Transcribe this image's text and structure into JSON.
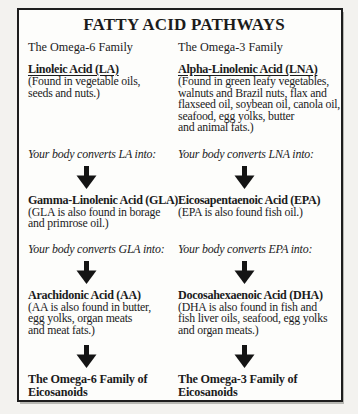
{
  "panel": {
    "title": "FATTY ACID PATHWAYS"
  },
  "omega6": {
    "family_label": "The Omega-6 Family",
    "source_name": "Linoleic Acid (LA)",
    "source_desc": "(Found in vegetable oils,\nseeds and nuts.)",
    "converts_1": "Your body converts LA into:",
    "step2_name": "Gamma-Linolenic Acid (GLA)",
    "step2_desc": "(GLA is also found in borage\nand primrose oil.)",
    "converts_2": "Your body converts GLA into:",
    "step3_name": "Arachidonic Acid (AA)",
    "step3_desc": "(AA is also found in butter,\negg yolks, organ meats\nand meat fats.)",
    "final_label": "The Omega-6 Family of\nEicosanoids"
  },
  "omega3": {
    "family_label": "The Omega-3 Family",
    "source_name": "Alpha-Linolenic Acid (LNA)",
    "source_desc": "(Found in green leafy vegetables,\nwalnuts and Brazil nuts, flax and\nflaxseed oil, soybean oil, canola oil,\nseafood, egg yolks, butter\nand animal fats.)",
    "converts_1": "Your body converts LNA into:",
    "step2_name": "Eicosapentaenoic Acid (EPA)",
    "step2_desc": "(EPA is also found fish oil.)",
    "converts_2": "Your body converts EPA into:",
    "step3_name": "Docosahexaenoic Acid (DHA)",
    "step3_desc": "(DHA is also found in fish and\nfish liver oils, seafood, egg yolks\nand organ meats.)",
    "final_label": "The Omega-3 Family of\nEicosanoids"
  },
  "icons": {
    "down_arrow": "down-arrow",
    "arrow_color": "#141414"
  }
}
